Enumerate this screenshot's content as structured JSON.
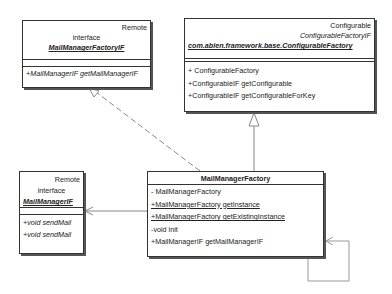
{
  "diagram": {
    "type": "uml-class-diagram",
    "classes": [
      {
        "id": "mailmanagerfactoryif",
        "stereotype": "Remote",
        "kind": "interface",
        "name": "MailManagerFactoryIF",
        "attributes": [],
        "operations": [
          "+MailManagerIF getMailManagerIF"
        ]
      },
      {
        "id": "configurablefactory",
        "stereotype": "Configurable",
        "interface": "ConfigurableFactoryIF",
        "name": "com.abien.framework.base.ConfigurableFactory",
        "attributes": [],
        "operations": [
          "+ ConfigurableFactory",
          "+ConfigurableIF getConfigurable",
          "+ConfigurableIF getConfigurableForKey"
        ]
      },
      {
        "id": "mailmanagerif",
        "stereotype": "Remote",
        "kind": "interface",
        "name": "MailManagerIF",
        "attributes": [],
        "operations": [
          "+void sendMail",
          "+void sendMail"
        ]
      },
      {
        "id": "mailmanagerfactory",
        "name": "MailManagerFactory",
        "operations": [
          "- MailManagerFactory",
          "+MailManagerFactory getInstance",
          "+MailManagerFactory getExistingInstance",
          "-void init",
          "+MailManagerIF getMailManagerIF"
        ]
      }
    ],
    "relations": [
      {
        "from": "MailManagerFactory",
        "to": "MailManagerFactoryIF",
        "type": "realization"
      },
      {
        "from": "MailManagerFactory",
        "to": "ConfigurableFactory",
        "type": "generalization"
      },
      {
        "from": "MailManagerFactory",
        "to": "MailManagerIF",
        "type": "association"
      },
      {
        "from": "MailManagerFactory",
        "to": "MailManagerFactory",
        "type": "self-association"
      }
    ]
  }
}
